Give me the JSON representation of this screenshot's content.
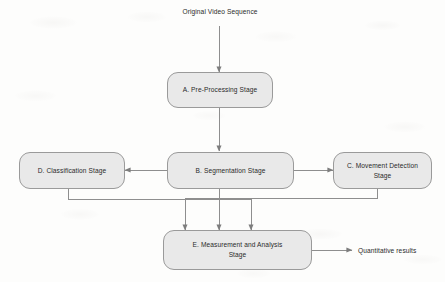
{
  "diagram": {
    "title_label": "Original Video Sequence",
    "nodes": [
      {
        "id": "A",
        "label": "A. Pre-Processing Stage"
      },
      {
        "id": "B",
        "label": "B. Segmentation Stage"
      },
      {
        "id": "C",
        "label": "C. Movement Detection Stage"
      },
      {
        "id": "D",
        "label": "D. Classification Stage"
      },
      {
        "id": "E",
        "label": "E. Measurement and Analysis\nStage"
      }
    ],
    "output_label": "Quantitative results",
    "colors": {
      "node_fill": "#e9e9e9",
      "node_border": "#9a9a9a",
      "connector": "#8e8e8e",
      "text": "#2a2a2a",
      "background": "#fdfdfc"
    }
  }
}
